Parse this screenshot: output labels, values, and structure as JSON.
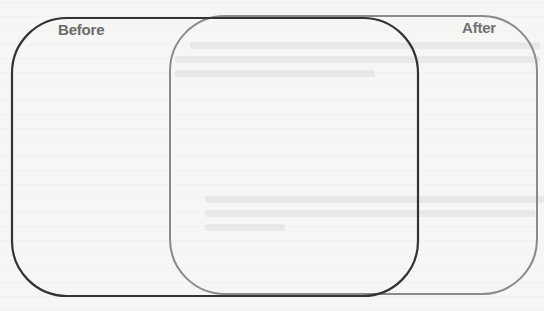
{
  "diagram": {
    "type": "overlapping-comparison",
    "sets": [
      {
        "id": "before",
        "label": "Before",
        "stroke_color": "#333333",
        "label_color": "#6a6a6a"
      },
      {
        "id": "after",
        "label": "After",
        "stroke_color": "#8a8a8a",
        "label_color": "#707070"
      }
    ],
    "overlap_region": {
      "label": ""
    }
  },
  "colors": {
    "background": "#f6f6f4",
    "before_stroke": "#333333",
    "after_stroke": "#8a8a8a"
  }
}
